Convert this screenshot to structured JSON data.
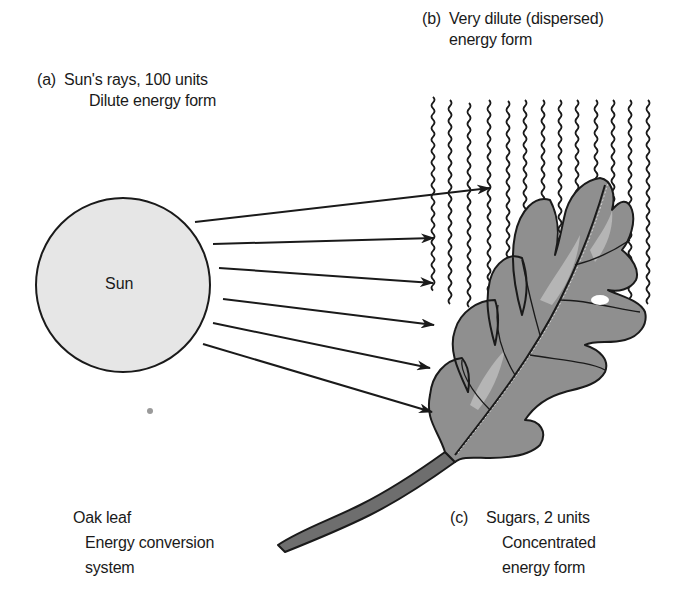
{
  "diagram": {
    "type": "energy-conversion-illustration",
    "labels": {
      "a": {
        "tag": "(a)",
        "line1": "Sun's rays, 100 units",
        "line2": "Dilute energy form"
      },
      "b": {
        "tag": "(b)",
        "line1": "Very dilute (dispersed)",
        "line2": "energy form"
      },
      "c": {
        "tag": "(c)",
        "line1": "Sugars, 2 units",
        "line2": "Concentrated",
        "line3": "energy form"
      },
      "oak": {
        "line1": "Oak leaf",
        "line2": "Energy conversion",
        "line3": "system"
      }
    },
    "nodes": [
      {
        "id": "sun",
        "label": "Sun",
        "shape": "circle",
        "fill": "#e6e6e6"
      },
      {
        "id": "leaf",
        "label": "Oak leaf",
        "shape": "illustration",
        "fill": "#8c8c8c"
      },
      {
        "id": "dispersed",
        "label": "Very dilute (dispersed) energy form",
        "shape": "wavy-lines"
      }
    ],
    "edges": [
      {
        "from": "sun",
        "to": "leaf",
        "kind": "arrow",
        "count": 6,
        "meaning": "sun's rays"
      }
    ],
    "sun_label": "Sun",
    "colors": {
      "ink": "#1a1a1a",
      "sun_fill": "#e6e6e6",
      "leaf_fill": "#8f8f8f",
      "leaf_light": "#b5b5b5"
    }
  }
}
